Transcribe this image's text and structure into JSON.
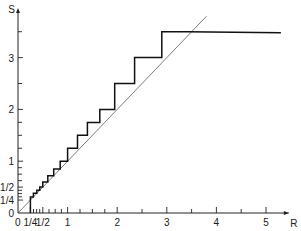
{
  "chart_data": {
    "type": "line",
    "title": "",
    "xlabel": "R",
    "ylabel": "S",
    "origin_label": "0",
    "xlim": [
      0,
      5.5
    ],
    "ylim": [
      0,
      3.9
    ],
    "grid": false,
    "legend": null,
    "x_ticks": [
      {
        "value": 0,
        "label": "0"
      },
      {
        "value": 0.25,
        "label": "1/4"
      },
      {
        "value": 0.5,
        "label": "1/2"
      },
      {
        "value": 1,
        "label": "1"
      },
      {
        "value": 2,
        "label": "2"
      },
      {
        "value": 3,
        "label": "3"
      },
      {
        "value": 4,
        "label": "4"
      },
      {
        "value": 5,
        "label": "5"
      }
    ],
    "x_minor_ticks": [
      0.3125,
      0.375,
      0.4375,
      0.625,
      0.75,
      0.875,
      1.25,
      1.5,
      1.75,
      2.5,
      3.5,
      4.5
    ],
    "y_ticks": [
      {
        "value": 0,
        "label": "0"
      },
      {
        "value": 0.25,
        "label": "1/4"
      },
      {
        "value": 0.5,
        "label": "1/2"
      },
      {
        "value": 1,
        "label": "1"
      },
      {
        "value": 2,
        "label": "2"
      },
      {
        "value": 3,
        "label": "3"
      }
    ],
    "y_minor_ticks": [
      0.3125,
      0.375,
      0.4375,
      0.625,
      0.75,
      0.875,
      1.25,
      1.5,
      1.75,
      2.5,
      3.5
    ],
    "series": [
      {
        "name": "diagonal S = R",
        "style": "thin",
        "x": [
          0,
          3.8
        ],
        "y": [
          0,
          3.8
        ]
      },
      {
        "name": "staircase S(R)",
        "style": "thick",
        "x": [
          0.25,
          0.25,
          0.31,
          0.31,
          0.38,
          0.38,
          0.44,
          0.44,
          0.5,
          0.5,
          0.6,
          0.6,
          0.72,
          0.72,
          0.85,
          0.85,
          1.0,
          1.0,
          1.2,
          1.2,
          1.4,
          1.4,
          1.65,
          1.65,
          1.95,
          1.95,
          2.35,
          2.35,
          2.9,
          2.9,
          3.4,
          3.4,
          5.3
        ],
        "y": [
          0,
          0.31,
          0.31,
          0.38,
          0.38,
          0.44,
          0.44,
          0.5,
          0.5,
          0.6,
          0.6,
          0.72,
          0.72,
          0.85,
          0.85,
          1.0,
          1.0,
          1.25,
          1.25,
          1.5,
          1.5,
          1.75,
          1.75,
          2.0,
          2.0,
          2.5,
          2.5,
          3.0,
          3.0,
          3.5,
          3.5,
          3.5,
          3.48
        ]
      }
    ]
  }
}
